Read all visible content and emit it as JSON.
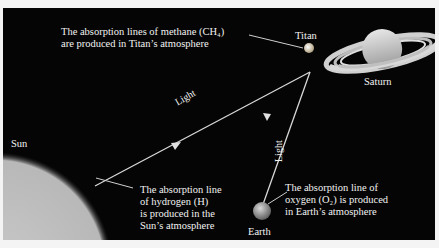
{
  "diagram": {
    "bodies": {
      "sun": "Sun",
      "titan": "Titan",
      "saturn": "Saturn",
      "earth": "Earth"
    },
    "light_labels": [
      "Light",
      "Light"
    ],
    "callouts": {
      "titan": [
        "The absorption lines of methane (CH₄)",
        "are produced in Titan’s atmosphere"
      ],
      "sun": [
        "The absorption line",
        "of hydrogen (H)",
        "is produced in the",
        "Sun’s atmosphere"
      ],
      "earth": [
        "The absorption line of",
        "oxygen (O₂) is produced",
        "in Earth’s atmosphere"
      ]
    },
    "colors": {
      "background": "#050505",
      "sun": "#c8c8c8",
      "line": "#d8d8d8",
      "text": "#f2f2f2"
    }
  }
}
